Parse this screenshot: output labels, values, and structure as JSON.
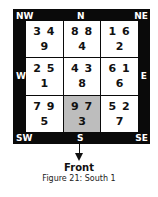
{
  "directions": {
    "nw": "NW",
    "n": "N",
    "ne": "NE",
    "w": "W",
    "e": "E",
    "sw": "SW",
    "s": "S",
    "se": "SE"
  },
  "grid": [
    {
      "pos": "NW",
      "top": "3 4",
      "bottom": "9"
    },
    {
      "pos": "N",
      "top": "8 8",
      "bottom": "4"
    },
    {
      "pos": "NE",
      "top": "1 6",
      "bottom": "2"
    },
    {
      "pos": "W",
      "top": "2 5",
      "bottom": "1"
    },
    {
      "pos": "C",
      "top": "4 3",
      "bottom": "8"
    },
    {
      "pos": "E",
      "top": "6 1",
      "bottom": "6"
    },
    {
      "pos": "SW",
      "top": "7 9",
      "bottom": "5"
    },
    {
      "pos": "S",
      "top": "9 7",
      "bottom": "3",
      "highlighted": true
    },
    {
      "pos": "SE",
      "top": "5 2",
      "bottom": "7"
    }
  ],
  "front_label": "Front",
  "caption": "Figure 21: South 1",
  "colors": {
    "frame": "#0a0a0a",
    "highlight": "#bdbdbd"
  }
}
